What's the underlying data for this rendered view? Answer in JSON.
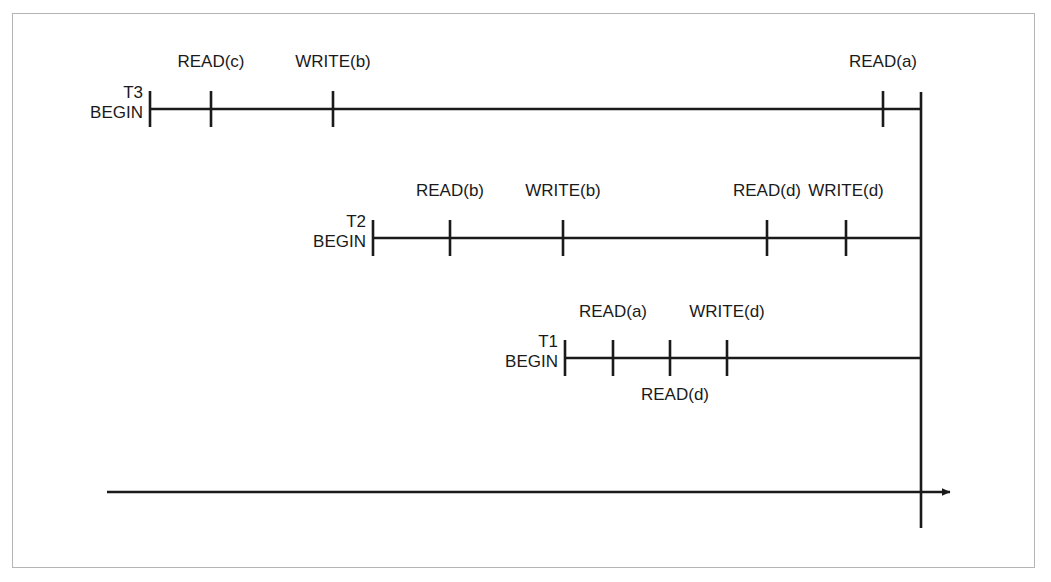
{
  "diagram": {
    "type": "transaction-schedule-timeline",
    "colors": {
      "line": "#1a1a1a",
      "text": "#1a1a1a",
      "border": "#b5b5b5",
      "background": "#ffffff"
    },
    "time_axis": {
      "name": "time-axis",
      "arrow_label": "",
      "start_x": 107,
      "end_x": 950,
      "y": 492
    },
    "commit_line": {
      "name": "commit-vertical-line",
      "x": 921,
      "top_y": 92,
      "bottom_y": 528
    },
    "transactions": [
      {
        "id": "T3",
        "name": "T3",
        "begin_label": "BEGIN",
        "label_x": 143,
        "label_y": 83,
        "line_y": 109,
        "start_x": 150,
        "end_x": 921,
        "operations": [
          {
            "label": "READ(c)",
            "x": 211,
            "label_y": 52,
            "position": "above"
          },
          {
            "label": "WRITE(b)",
            "x": 333,
            "label_y": 52,
            "position": "above"
          },
          {
            "label": "READ(a)",
            "x": 883,
            "label_y": 52,
            "position": "above"
          }
        ]
      },
      {
        "id": "T2",
        "name": "T2",
        "begin_label": "BEGIN",
        "label_x": 366,
        "label_y": 212,
        "line_y": 238,
        "start_x": 373,
        "end_x": 921,
        "operations": [
          {
            "label": "READ(b)",
            "x": 450,
            "label_y": 181,
            "position": "above"
          },
          {
            "label": "WRITE(b)",
            "x": 563,
            "label_y": 181,
            "position": "above"
          },
          {
            "label": "READ(d)",
            "x": 767,
            "label_y": 181,
            "position": "above"
          },
          {
            "label": "WRITE(d)",
            "x": 846,
            "label_y": 181,
            "position": "above"
          }
        ]
      },
      {
        "id": "T1",
        "name": "T1",
        "begin_label": "BEGIN",
        "label_x": 558,
        "label_y": 332,
        "line_y": 358,
        "start_x": 565,
        "end_x": 921,
        "operations": [
          {
            "label": "READ(a)",
            "x": 613,
            "label_y": 302,
            "position": "above"
          },
          {
            "label": "WRITE(d)",
            "x": 727,
            "label_y": 302,
            "position": "above"
          },
          {
            "label": "READ(d)",
            "x": 675,
            "label_y": 385,
            "position": "below",
            "tick_x": 670
          }
        ]
      }
    ]
  }
}
